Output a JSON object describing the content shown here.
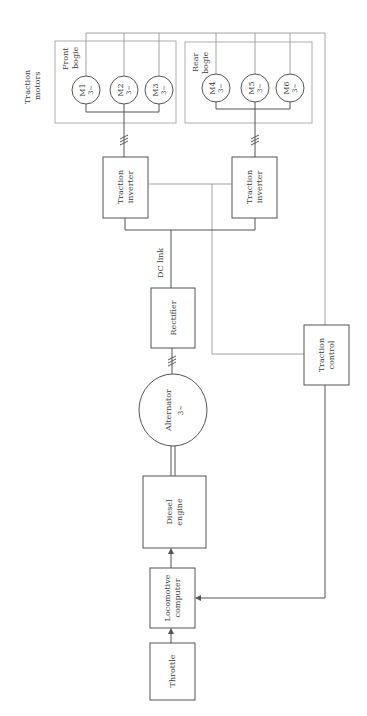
{
  "diagram": {
    "orientation": "rotated -90deg (text reads bottom-to-top)",
    "colors": {
      "line": "#555555",
      "text": "#3a3a3a",
      "group_border": "#9a9a9a",
      "background": "#ffffff"
    },
    "labels": {
      "traction_motors_line1": "Traction",
      "traction_motors_line2": "motors",
      "front_bogie_line1": "Front",
      "front_bogie_line2": "bogie",
      "rear_bogie_line1": "Rear",
      "rear_bogie_line2": "bogie",
      "dc_link": "DC link"
    },
    "motors": [
      {
        "id": "M1",
        "phase": "3~"
      },
      {
        "id": "M2",
        "phase": "3~"
      },
      {
        "id": "M3",
        "phase": "3~"
      },
      {
        "id": "M4",
        "phase": "3~"
      },
      {
        "id": "M5",
        "phase": "3~"
      },
      {
        "id": "M6",
        "phase": "3~"
      }
    ],
    "blocks": {
      "inverter_front_line1": "Traction",
      "inverter_front_line2": "inverter",
      "inverter_rear_line1": "Traction",
      "inverter_rear_line2": "inverter",
      "rectifier": "Rectifier",
      "alternator": "Alternator",
      "alternator_phase": "3~",
      "diesel_line1": "Diesel",
      "diesel_line2": "engine",
      "computer_line1": "Locomotive",
      "computer_line2": "computer",
      "throttle": "Throttle",
      "traction_control_line1": "Traction",
      "traction_control_line2": "control"
    },
    "three_phase_marker": "///",
    "connections": [
      {
        "from": "Throttle",
        "to": "Locomotive computer",
        "type": "arrow"
      },
      {
        "from": "Locomotive computer",
        "to": "Diesel engine",
        "type": "arrow"
      },
      {
        "from": "Diesel engine",
        "to": "Alternator",
        "type": "mechanical shaft"
      },
      {
        "from": "Alternator",
        "to": "Rectifier",
        "type": "3-phase"
      },
      {
        "from": "Rectifier",
        "to": "Traction inverters",
        "type": "DC link"
      },
      {
        "from": "Traction inverter (front)",
        "to": "Front bogie M1-M3",
        "type": "3-phase"
      },
      {
        "from": "Traction inverter (rear)",
        "to": "Rear bogie M4-M6",
        "type": "3-phase"
      },
      {
        "from": "Traction motors",
        "to": "Traction control",
        "type": "sensor feedback"
      },
      {
        "from": "Traction inverters",
        "to": "Traction control",
        "type": "control"
      },
      {
        "from": "Traction control",
        "to": "Locomotive computer",
        "type": "arrow"
      }
    ]
  }
}
